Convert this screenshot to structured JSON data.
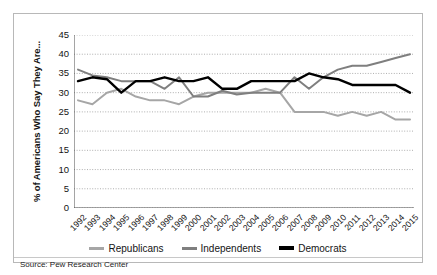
{
  "figure": {
    "source_note": "Source: Pew Research Center",
    "background_color": "#ffffff",
    "border_color": "#b8b8b8"
  },
  "legend": {
    "position": "bottom-center",
    "entries": [
      {
        "label": "Republicans",
        "color": "#a6a6a6",
        "weight": "normal"
      },
      {
        "label": "Independents",
        "color": "#7f7f7f",
        "weight": "normal"
      },
      {
        "label": "Democrats",
        "color": "#000000",
        "weight": "bold"
      }
    ]
  },
  "chart_data": {
    "type": "line",
    "title": "",
    "subtitle": "",
    "xlabel": "",
    "ylabel": "% of Americans Who Say They Are...",
    "ylim": [
      0,
      45
    ],
    "ytick_step": 5,
    "yticks": [
      "45",
      "40",
      "35",
      "30",
      "25",
      "20",
      "15",
      "10",
      "5",
      "0"
    ],
    "grid": "horizontal-dotted",
    "categories": [
      "1992",
      "1993",
      "1994",
      "1995",
      "1996",
      "1997",
      "1998",
      "1999",
      "2000",
      "2001",
      "2002",
      "2003",
      "2004",
      "2005",
      "2006",
      "2007",
      "2008",
      "2009",
      "2010",
      "2011",
      "2012",
      "2013",
      "2014",
      "2015"
    ],
    "series": [
      {
        "name": "Republicans",
        "color": "#a6a6a6",
        "values": [
          28,
          27,
          30,
          31,
          29,
          28,
          28,
          27,
          29,
          30,
          30,
          30,
          30,
          31,
          30,
          25,
          25,
          25,
          24,
          25,
          24,
          25,
          23,
          23
        ]
      },
      {
        "name": "Independents",
        "color": "#7f7f7f",
        "values": [
          36,
          34.5,
          34,
          33,
          33,
          33,
          31,
          34,
          29,
          29,
          30.5,
          29.5,
          30,
          30,
          30,
          34,
          31,
          34,
          36,
          37,
          37,
          38,
          39,
          40
        ]
      },
      {
        "name": "Democrats",
        "color": "#000000",
        "values": [
          33,
          34,
          33.5,
          30,
          33,
          33,
          34,
          33,
          33,
          34,
          31,
          31,
          33,
          33,
          33,
          33,
          35,
          34,
          33.5,
          32,
          32,
          32,
          32,
          30
        ]
      }
    ]
  }
}
